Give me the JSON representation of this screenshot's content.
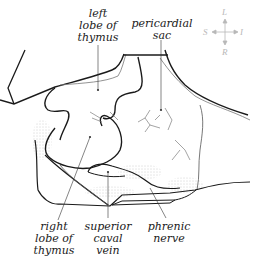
{
  "labels": {
    "left_lobe": "left\nlobe of\nthymus",
    "pericardial_sac": "pericardial\nsac",
    "right_lobe": "right\nlobe of\nthymus",
    "superior_caval_vein": "superior\ncaval\nvein",
    "phrenic_nerve": "phrenic\nnerve"
  },
  "compass": {
    "top": "L",
    "bottom": "R",
    "left": "S",
    "right": "I"
  },
  "colors": {
    "line": "#1a1a1a",
    "thin_line": "#555555",
    "compass": "#b8b8b8",
    "stipple": "#9a9a9a"
  }
}
